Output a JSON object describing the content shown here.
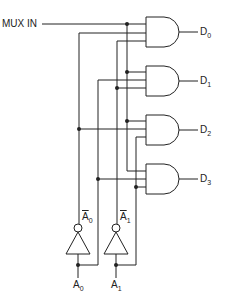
{
  "diagram": {
    "type": "1-to-4 demultiplexer logic circuit",
    "input_label": "MUX IN",
    "outputs": [
      {
        "base": "D",
        "sub": "0"
      },
      {
        "base": "D",
        "sub": "1"
      },
      {
        "base": "D",
        "sub": "2"
      },
      {
        "base": "D",
        "sub": "3"
      }
    ],
    "select_inputs": [
      {
        "base": "A",
        "sub": "0"
      },
      {
        "base": "A",
        "sub": "1"
      }
    ],
    "inverted_labels": [
      {
        "base": "A",
        "sub": "0"
      },
      {
        "base": "A",
        "sub": "1"
      }
    ],
    "gates": [
      {
        "name": "AND gate D0",
        "inputs": [
          "MUX IN",
          "A0-bar",
          "A1-bar"
        ]
      },
      {
        "name": "AND gate D1",
        "inputs": [
          "MUX IN",
          "A0",
          "A1-bar"
        ]
      },
      {
        "name": "AND gate D2",
        "inputs": [
          "MUX IN",
          "A0-bar",
          "A1"
        ]
      },
      {
        "name": "AND gate D3",
        "inputs": [
          "MUX IN",
          "A0",
          "A1"
        ]
      }
    ],
    "colors": {
      "line": "#222222",
      "background": "#ffffff"
    }
  }
}
